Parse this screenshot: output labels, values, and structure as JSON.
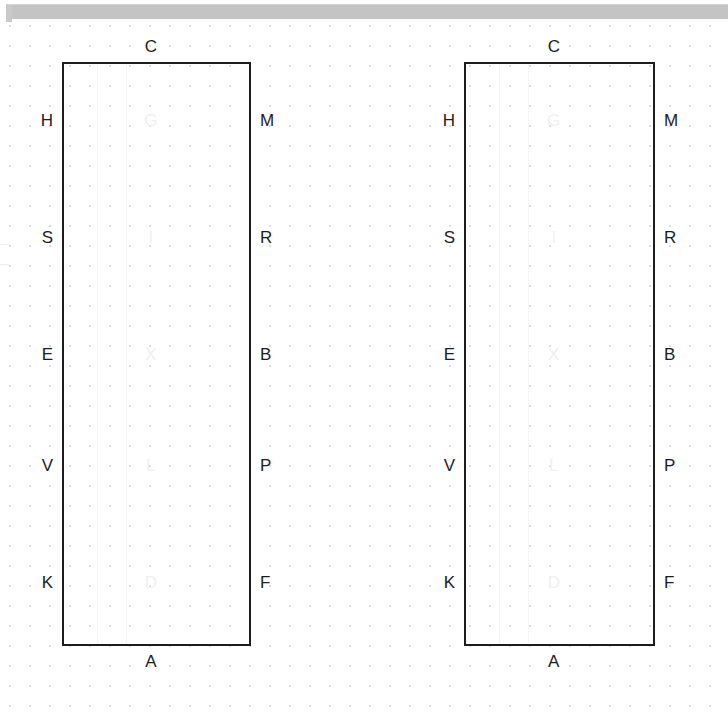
{
  "app": {
    "toolbar_visible": true,
    "toolbar_color": "#c4c4c4"
  },
  "canvas": {
    "background": "#ffffff",
    "grid": {
      "type": "dot",
      "spacing_px": 20,
      "color": "#dcdcdc"
    }
  },
  "shapes": [
    {
      "id": "shape-1",
      "name": "rectangle-left",
      "x": 62,
      "y": 62,
      "width": 189,
      "height": 584,
      "stroke": "#1d1d1d",
      "stroke_width": 2.5,
      "fill": "none",
      "ports": {
        "top": [
          {
            "label": "C",
            "offset_pct": 47
          }
        ],
        "bottom": [
          {
            "label": "A",
            "offset_pct": 47
          }
        ],
        "left": [
          {
            "label": "H",
            "offset_pct": 10
          },
          {
            "label": "S",
            "offset_pct": 30
          },
          {
            "label": "E",
            "offset_pct": 50
          },
          {
            "label": "V",
            "offset_pct": 69
          },
          {
            "label": "K",
            "offset_pct": 89
          }
        ],
        "right": [
          {
            "label": "M",
            "offset_pct": 10
          },
          {
            "label": "R",
            "offset_pct": 30
          },
          {
            "label": "B",
            "offset_pct": 50
          },
          {
            "label": "P",
            "offset_pct": 69
          },
          {
            "label": "F",
            "offset_pct": 89
          }
        ],
        "inner": [
          {
            "label": "G",
            "x_pct": 47,
            "y_pct": 10
          },
          {
            "label": "I",
            "x_pct": 47,
            "y_pct": 30
          },
          {
            "label": "X",
            "x_pct": 47,
            "y_pct": 50
          },
          {
            "label": "L",
            "x_pct": 47,
            "y_pct": 69
          },
          {
            "label": "D",
            "x_pct": 47,
            "y_pct": 89
          }
        ]
      }
    },
    {
      "id": "shape-2",
      "name": "rectangle-right",
      "x": 464,
      "y": 62,
      "width": 191,
      "height": 584,
      "stroke": "#1d1d1d",
      "stroke_width": 2.5,
      "fill": "none",
      "ports": {
        "top": [
          {
            "label": "C",
            "offset_pct": 47
          }
        ],
        "bottom": [
          {
            "label": "A",
            "offset_pct": 47
          }
        ],
        "left": [
          {
            "label": "H",
            "offset_pct": 10
          },
          {
            "label": "S",
            "offset_pct": 30
          },
          {
            "label": "E",
            "offset_pct": 50
          },
          {
            "label": "V",
            "offset_pct": 69
          },
          {
            "label": "K",
            "offset_pct": 89
          }
        ],
        "right": [
          {
            "label": "M",
            "offset_pct": 10
          },
          {
            "label": "R",
            "offset_pct": 30
          },
          {
            "label": "B",
            "offset_pct": 50
          },
          {
            "label": "P",
            "offset_pct": 69
          },
          {
            "label": "F",
            "offset_pct": 89
          }
        ],
        "inner": [
          {
            "label": "G",
            "x_pct": 47,
            "y_pct": 10
          },
          {
            "label": "I",
            "x_pct": 47,
            "y_pct": 30
          },
          {
            "label": "X",
            "x_pct": 47,
            "y_pct": 50
          },
          {
            "label": "L",
            "x_pct": 47,
            "y_pct": 69
          },
          {
            "label": "D",
            "x_pct": 47,
            "y_pct": 89
          }
        ]
      }
    }
  ]
}
